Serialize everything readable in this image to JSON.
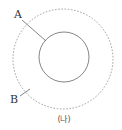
{
  "diagram": {
    "labels": {
      "a": "A",
      "b": "B"
    },
    "caption": "(나)",
    "colors": {
      "inner_circle": "#666666",
      "outer_circle": "#8a8a8a",
      "leader_line": "#666666",
      "text": "#333333"
    },
    "shapes": {
      "inner_circle": {
        "style": "solid",
        "cx": 64,
        "cy": 57,
        "r": 25
      },
      "outer_circle": {
        "style": "dashed",
        "cx": 63,
        "cy": 59,
        "r": 50
      }
    }
  }
}
